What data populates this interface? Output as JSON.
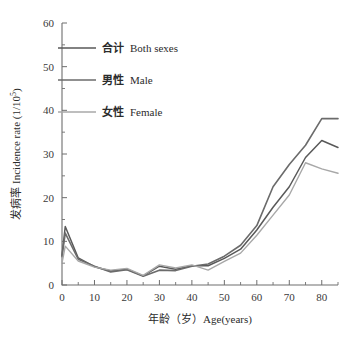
{
  "chart_data": {
    "type": "line",
    "title": "",
    "xlabel": "年龄（岁）Age(years)",
    "ylabel": "发病率 Incidence rate (1/10⁵)",
    "xlim": [
      0,
      85
    ],
    "ylim": [
      0,
      60
    ],
    "grid": false,
    "legend_position": "upper-left",
    "x_ticks": [
      0,
      10,
      20,
      30,
      40,
      50,
      60,
      70,
      80
    ],
    "x_tick_labels": [
      "0",
      "10",
      "20",
      "30",
      "40",
      "50",
      "60",
      "70",
      "80"
    ],
    "x_minor_ticks": [
      5,
      15,
      25,
      35,
      45,
      55,
      65,
      75,
      85
    ],
    "y_ticks": [
      0,
      10,
      20,
      30,
      40,
      50,
      60
    ],
    "y_tick_labels": [
      "0",
      "10",
      "20",
      "30",
      "40",
      "50",
      "60"
    ],
    "y_minor_ticks": [
      5,
      15,
      25,
      35,
      45,
      55
    ],
    "x": [
      0,
      1,
      5,
      10,
      15,
      20,
      25,
      30,
      35,
      40,
      45,
      50,
      55,
      60,
      65,
      70,
      75,
      80,
      85
    ],
    "series": [
      {
        "name": "合计  Both sexes",
        "name_cjk": "合计",
        "name_latin": "Both sexes",
        "color": "#595959",
        "width": 1.5,
        "values": [
          6.8,
          13.4,
          6.2,
          4.2,
          3.2,
          3.6,
          2.1,
          4.3,
          3.6,
          4.4,
          4.4,
          6.1,
          8.2,
          12.6,
          17.8,
          22.5,
          29.2,
          33.1,
          31.5
        ]
      },
      {
        "name": "男性  Male",
        "name_cjk": "男性",
        "name_latin": "Male",
        "color": "#6b6b6b",
        "width": 1.6,
        "values": [
          6.5,
          11.9,
          5.9,
          4.3,
          3.0,
          3.5,
          2.0,
          3.4,
          3.3,
          4.3,
          4.8,
          6.6,
          9.1,
          13.6,
          21.2,
          27.6,
          38.1,
          51.6,
          53.1
        ]
      },
      {
        "name": "女性  Female",
        "name_cjk": "女性",
        "name_latin": "Female",
        "color": "#a8a8a8",
        "width": 1.4,
        "values": [
          5.0,
          8.9,
          5.5,
          4.1,
          3.4,
          3.8,
          2.2,
          4.6,
          3.9,
          4.6,
          3.4,
          5.4,
          7.3,
          11.4,
          16.0,
          20.6,
          28.0,
          26.6,
          25.6
        ]
      }
    ],
    "series_male_detail": {
      "name": "男性  Male",
      "values": [
        6.5,
        11.9,
        5.9,
        4.3,
        3.0,
        3.5,
        2.0,
        3.4,
        3.3,
        4.3,
        4.8,
        6.6,
        9.1,
        13.6,
        22.5,
        27.6,
        32.0,
        38.1,
        38.1
      ]
    }
  }
}
